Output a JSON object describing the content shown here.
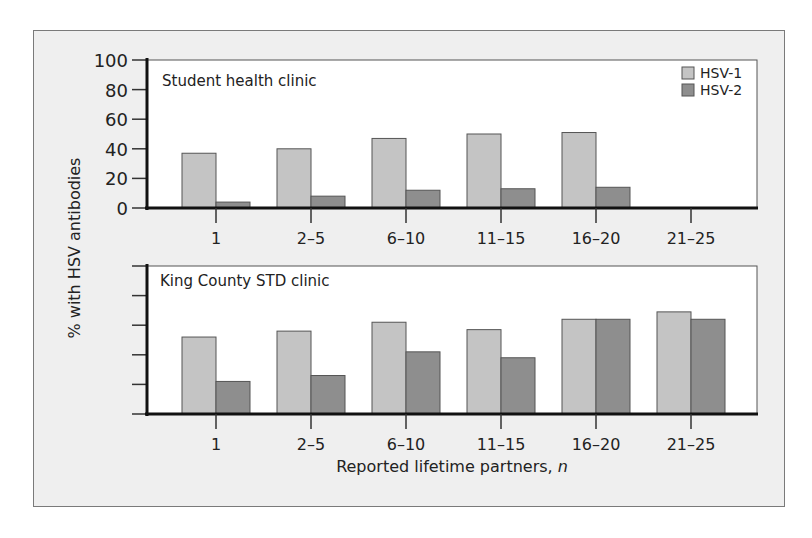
{
  "chart_data": [
    {
      "type": "bar",
      "title": "Student health clinic",
      "xlabel": "",
      "ylabel": "% with HSV antibodies",
      "ylim": [
        0,
        100
      ],
      "yticks": [
        0,
        20,
        40,
        60,
        80,
        100
      ],
      "categories": [
        "1",
        "2–5",
        "6–10",
        "11–15",
        "16–20",
        "21–25"
      ],
      "series": [
        {
          "name": "HSV-1",
          "values": [
            37,
            40,
            47,
            50,
            51,
            null
          ]
        },
        {
          "name": "HSV-2",
          "values": [
            4,
            8,
            12,
            13,
            14,
            null
          ]
        }
      ],
      "legend": {
        "position": "top-right",
        "entries": [
          "HSV-1",
          "HSV-2"
        ]
      },
      "grid": false
    },
    {
      "type": "bar",
      "title": "King County STD clinic",
      "xlabel": "Reported lifetime partners, n",
      "ylabel": "% with HSV antibodies",
      "ylim": [
        0,
        100
      ],
      "yticks": [
        0,
        20,
        40,
        60,
        80,
        100
      ],
      "categories": [
        "1",
        "2–5",
        "6–10",
        "11–15",
        "16–20",
        "21–25"
      ],
      "series": [
        {
          "name": "HSV-1",
          "values": [
            52,
            56,
            62,
            57,
            64,
            69
          ]
        },
        {
          "name": "HSV-2",
          "values": [
            22,
            26,
            42,
            38,
            64,
            64
          ]
        }
      ],
      "grid": false
    }
  ],
  "labels": {
    "ylabel": "% with HSV antibodies",
    "xlabel_main": "Reported lifetime partners, ",
    "xlabel_italic": "n",
    "top_title": "Student health clinic",
    "bottom_title": "King County STD clinic",
    "legend_1": "HSV-1",
    "legend_2": "HSV-2",
    "yticks": [
      "100",
      "80",
      "60",
      "40",
      "20",
      "0"
    ],
    "categories": [
      "1",
      "2–5",
      "6–10",
      "11–15",
      "16–20",
      "21–25"
    ]
  },
  "colors": {
    "hsv1": "#c4c4c4",
    "hsv2": "#8e8e8e",
    "frame_bg": "#efefef",
    "plot_bg": "#ffffff",
    "axis": "#111111"
  }
}
